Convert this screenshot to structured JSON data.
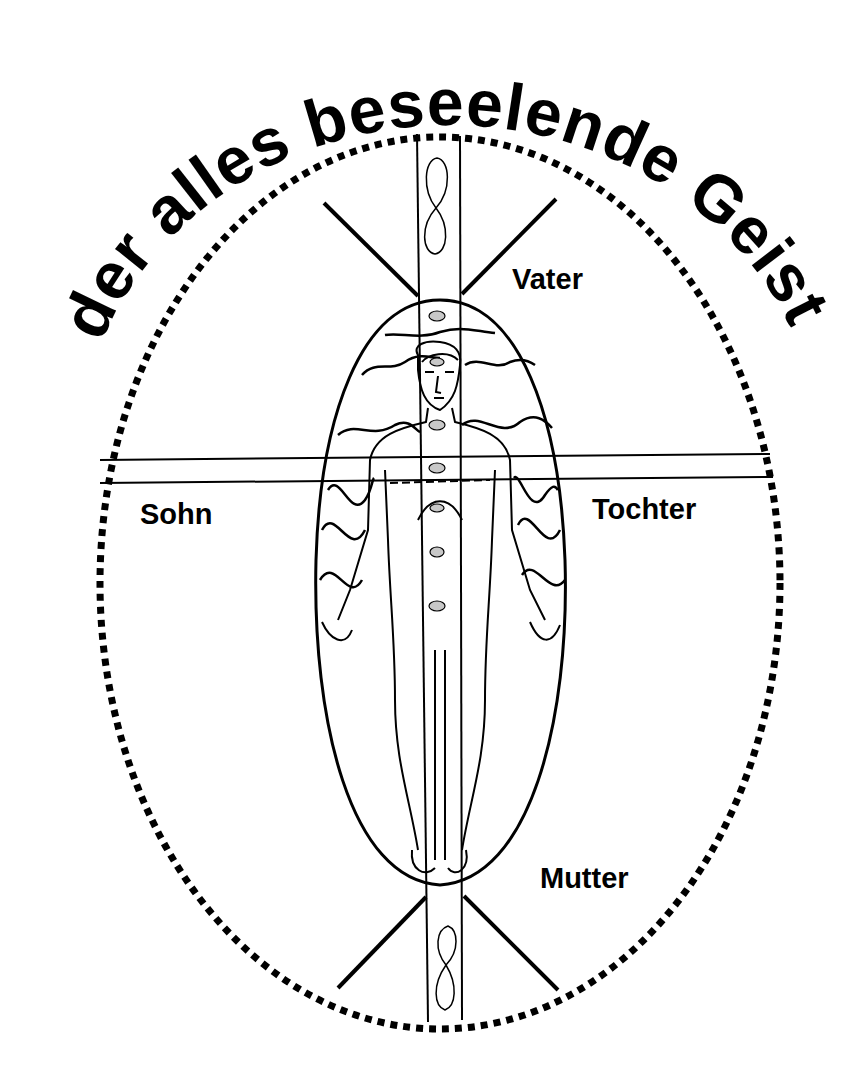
{
  "title": "der alles beseelende Geist",
  "labels": {
    "top": "Vater",
    "left": "Sohn",
    "right": "Tochter",
    "bottom": "Mutter"
  },
  "colors": {
    "ink": "#000000",
    "background": "#ffffff",
    "chakra_fill": "#c8c8c8"
  },
  "elements": {
    "outer_ellipse": "dotted-ellipse",
    "aura": "egg-shaped-aura",
    "figure": "standing-human-figure",
    "chakras_count": 7,
    "lemniscates": 2
  }
}
